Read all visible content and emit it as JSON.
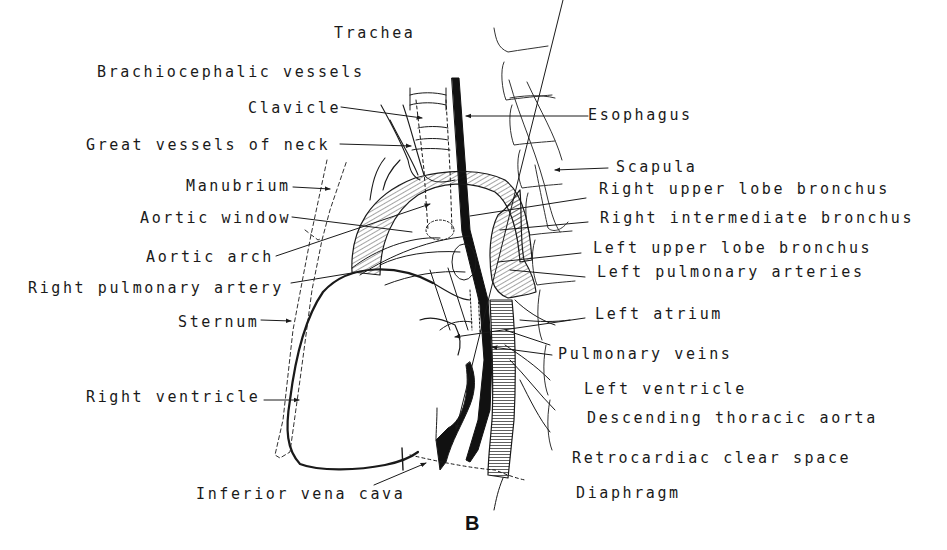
{
  "figure": {
    "panel_letter": "B",
    "ink_color": "#1a1a1a",
    "background": "#ffffff"
  },
  "labels": {
    "left": [
      {
        "id": "trachea",
        "text": "Trachea"
      },
      {
        "id": "brachiocephalic-vessels",
        "text": "Brachiocephalic vessels"
      },
      {
        "id": "clavicle",
        "text": "Clavicle"
      },
      {
        "id": "great-vessels-of-neck",
        "text": "Great vessels of neck"
      },
      {
        "id": "manubrium",
        "text": "Manubrium"
      },
      {
        "id": "aortic-window",
        "text": "Aortic window"
      },
      {
        "id": "aortic-arch",
        "text": "Aortic arch"
      },
      {
        "id": "right-pulmonary-artery",
        "text": "Right pulmonary artery"
      },
      {
        "id": "sternum",
        "text": "Sternum"
      },
      {
        "id": "right-ventricle",
        "text": "Right ventricle"
      },
      {
        "id": "inferior-vena-cava",
        "text": "Inferior vena cava"
      }
    ],
    "right": [
      {
        "id": "esophagus",
        "text": "Esophagus"
      },
      {
        "id": "scapula",
        "text": "Scapula"
      },
      {
        "id": "right-upper-lobe-bronchus",
        "text": "Right upper lobe bronchus"
      },
      {
        "id": "right-intermediate-bronchus",
        "text": "Right intermediate bronchus"
      },
      {
        "id": "left-upper-lobe-bronchus",
        "text": "Left upper lobe bronchus"
      },
      {
        "id": "left-pulmonary-arteries",
        "text": "Left pulmonary arteries"
      },
      {
        "id": "left-atrium",
        "text": "Left atrium"
      },
      {
        "id": "pulmonary-veins",
        "text": "Pulmonary veins"
      },
      {
        "id": "left-ventricle",
        "text": "Left ventricle"
      },
      {
        "id": "descending-thoracic-aorta",
        "text": "Descending thoracic aorta"
      },
      {
        "id": "retrocardiac-clear-space",
        "text": "Retrocardiac clear space"
      },
      {
        "id": "diaphragm",
        "text": "Diaphragm"
      }
    ]
  }
}
